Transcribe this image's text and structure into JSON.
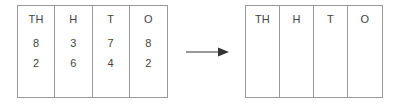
{
  "diagram": {
    "type": "place-value-chart-transformation",
    "source_table": {
      "label": "source-place-value-table",
      "headers": [
        "TH",
        "H",
        "T",
        "O"
      ],
      "rows": [
        [
          "8",
          "3",
          "7",
          "8"
        ],
        [
          "2",
          "6",
          "4",
          "2"
        ]
      ],
      "empty_row_count": 2
    },
    "arrow": {
      "label": "transformation-arrow",
      "direction": "right",
      "glyph": "→"
    },
    "target_table": {
      "label": "target-place-value-table",
      "headers": [
        "TH",
        "H",
        "T",
        "O"
      ],
      "rows": [],
      "empty_row_count": 4
    }
  },
  "colors": {
    "border": "#999999",
    "text": "#444444",
    "background": "#ffffff",
    "arrow": "#333333"
  }
}
